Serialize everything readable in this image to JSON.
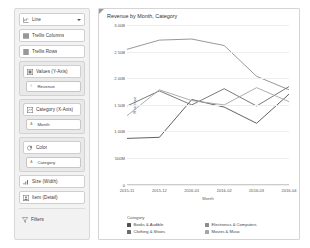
{
  "sidebar": {
    "chart_type": {
      "label": "Line",
      "icon": "line-chart-icon",
      "has_dropdown": true
    },
    "shelves": [
      {
        "label": "Trellis Columns",
        "icon": "trellis-columns-icon"
      },
      {
        "label": "Trellis Rows",
        "icon": "trellis-rows-icon"
      }
    ],
    "values_group": {
      "label": "Values (Y-Axis)",
      "icon": "values-icon",
      "fields": [
        {
          "label": "Revenue",
          "icon": "measure-icon"
        }
      ]
    },
    "category_group": {
      "label": "Category (X-Axis)",
      "icon": "category-icon",
      "fields": [
        {
          "label": "Month",
          "icon": "dimension-icon"
        }
      ]
    },
    "color_group": {
      "label": "Color",
      "icon": "color-icon",
      "fields": [
        {
          "label": "Category",
          "icon": "dimension-icon"
        }
      ]
    },
    "bottom_shelves": [
      {
        "label": "Size (Width)",
        "icon": "size-icon"
      },
      {
        "label": "Item (Detail)",
        "icon": "item-detail-icon"
      }
    ],
    "filters": {
      "label": "Filters",
      "icon": "filter-icon"
    }
  },
  "panel": {
    "title": "Revenue by Month, Category"
  },
  "chart_data": {
    "type": "line",
    "title": "Revenue by Month, Category",
    "xlabel": "Month",
    "ylabel": "Revenue",
    "grid": true,
    "legend_position": "bottom",
    "legend_title": "Category",
    "categories": [
      "2015-11",
      "2015-12",
      "2016-01",
      "2016-02",
      "2016-03",
      "2016-04"
    ],
    "yticks": [
      "3.00B",
      "2.50B",
      "2.00B",
      "1.50B",
      "1.00B",
      "500M",
      "0"
    ],
    "ytick_values": [
      3.0,
      2.5,
      2.0,
      1.5,
      1.0,
      0.5,
      0
    ],
    "ylim": [
      0,
      3.0
    ],
    "series": [
      {
        "name": "Books & Audible",
        "color": "#4f4f4f",
        "values": [
          0.9,
          0.92,
          1.62,
          1.48,
          1.18,
          1.72
        ]
      },
      {
        "name": "Electronics & Computers",
        "color": "#8c8c8c",
        "values": [
          2.55,
          2.72,
          2.74,
          2.62,
          2.05,
          1.8
        ]
      },
      {
        "name": "Clothing & Shoes",
        "color": "#6b6b6b",
        "values": [
          1.5,
          1.78,
          1.52,
          1.82,
          1.5,
          1.86
        ]
      },
      {
        "name": "Movies & Music",
        "color": "#a6a6a6",
        "values": [
          1.32,
          1.8,
          1.6,
          1.52,
          1.84,
          1.58
        ]
      }
    ]
  }
}
